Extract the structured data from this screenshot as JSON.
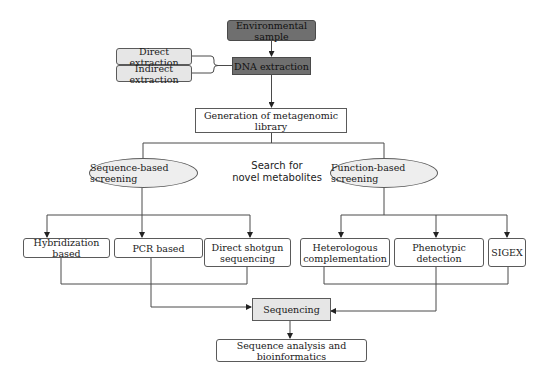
{
  "diagram": {
    "nodes": {
      "environmental_sample": "Environmental sample",
      "dna_extraction": "DNA extraction",
      "direct_extraction": "Direct extraction",
      "indirect_extraction": "Indirect extraction",
      "generation_library": "Generation of metagenomic library",
      "sequence_based": "Sequence-based screening",
      "function_based": "Function-based screening",
      "search_label_line1": "Search for",
      "search_label_line2": "novel metabolites",
      "hybridization": "Hybridization based",
      "pcr": "PCR based",
      "direct_shotgun_line1": "Direct shotgun",
      "direct_shotgun_line2": "sequencing",
      "heterologous_line1": "Heterologous",
      "heterologous_line2": "complementation",
      "phenotypic": "Phenotypic detection",
      "sigex": "SIGEX",
      "sequencing": "Sequencing",
      "analysis": "Sequence analysis and bioinformatics"
    },
    "edges": [
      [
        "environmental_sample",
        "dna_extraction"
      ],
      [
        "direct_extraction",
        "dna_extraction"
      ],
      [
        "indirect_extraction",
        "dna_extraction"
      ],
      [
        "dna_extraction",
        "generation_library"
      ],
      [
        "generation_library",
        "sequence_based"
      ],
      [
        "generation_library",
        "function_based"
      ],
      [
        "sequence_based",
        "hybridization"
      ],
      [
        "sequence_based",
        "pcr"
      ],
      [
        "sequence_based",
        "direct_shotgun"
      ],
      [
        "function_based",
        "heterologous"
      ],
      [
        "function_based",
        "phenotypic"
      ],
      [
        "function_based",
        "sigex"
      ],
      [
        "hybridization",
        "sequencing"
      ],
      [
        "pcr",
        "sequencing"
      ],
      [
        "direct_shotgun",
        "sequencing"
      ],
      [
        "heterologous",
        "sequencing"
      ],
      [
        "phenotypic",
        "sequencing"
      ],
      [
        "sigex",
        "sequencing"
      ],
      [
        "sequencing",
        "analysis"
      ]
    ],
    "colors": {
      "dark_fill": "#6f6f6f",
      "grey_fill": "#e6e6e6",
      "ellipse_fill": "#eeeeee",
      "line": "#4a4a4a"
    }
  }
}
